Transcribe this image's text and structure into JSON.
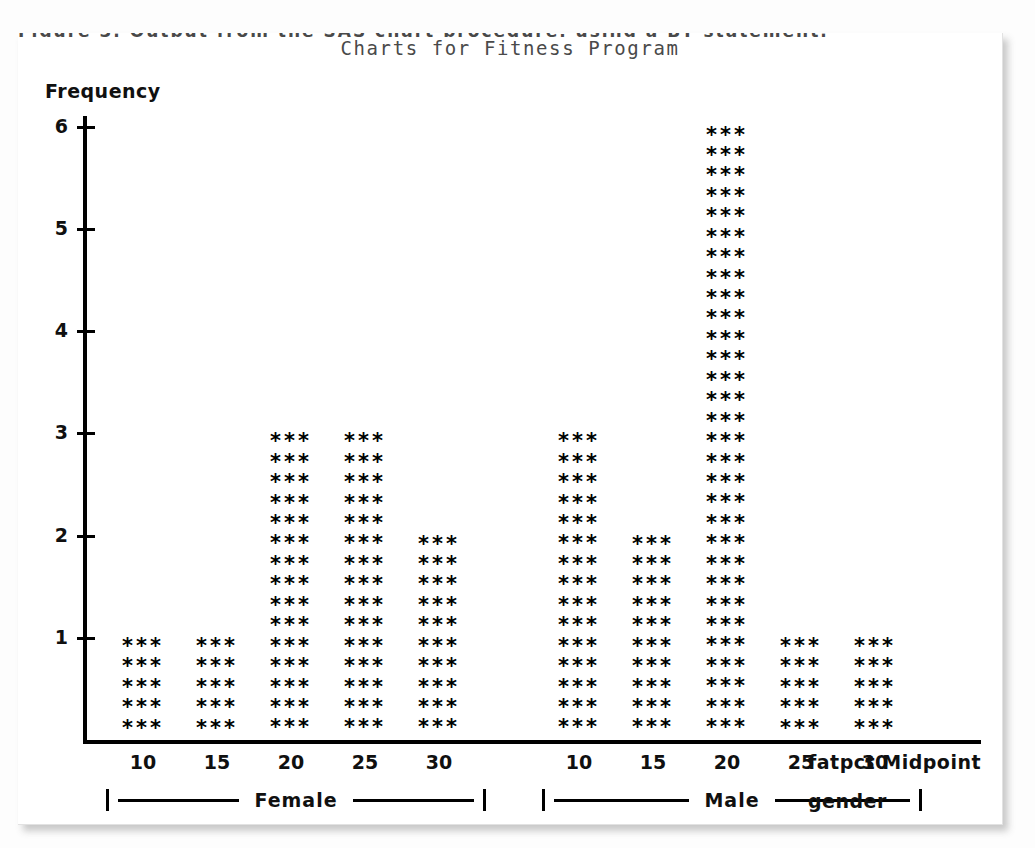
{
  "page": {
    "cutoff_header_text": "Figure 3.   Output from the SAS chart procedure, using a BY statement.",
    "background_color": "#fdfdfd",
    "sheet_color": "#ffffff",
    "ink_color": "#000000"
  },
  "chart_data": {
    "type": "bar",
    "title": "Charts for Fitness Program",
    "xlabel": "fatpct Midpoint",
    "ylabel": "Frequency",
    "group_axis_label": "gender",
    "ylim": [
      0,
      6
    ],
    "y_ticks": [
      6,
      5,
      4,
      3,
      2,
      1
    ],
    "grid": false,
    "legend": "none",
    "marker": "***",
    "rows_per_unit": 5,
    "categories": [
      10,
      15,
      20,
      25,
      30
    ],
    "groups": [
      {
        "name": "Female",
        "categories": [
          "10",
          "15",
          "20",
          "25",
          "30"
        ],
        "values": [
          1,
          1,
          3,
          3,
          2
        ]
      },
      {
        "name": "Male",
        "categories": [
          "10",
          "15",
          "20",
          "25",
          "30"
        ],
        "values": [
          3,
          2,
          6,
          1,
          1
        ]
      }
    ],
    "x_tick_labels": [
      "10",
      "15",
      "20",
      "25",
      "30",
      "10",
      "15",
      "20",
      "25",
      "30"
    ]
  }
}
